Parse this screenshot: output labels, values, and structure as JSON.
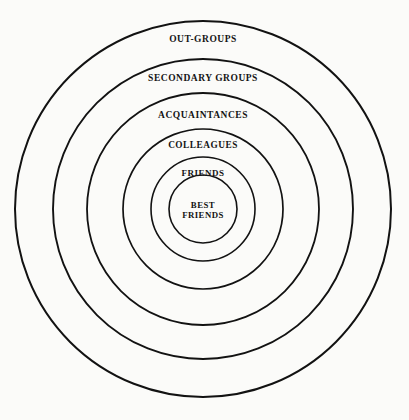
{
  "diagram": {
    "type": "concentric-circles",
    "background_color": "#fbfbf9",
    "stroke_color": "#121212",
    "center": {
      "x": 203,
      "y": 209
    },
    "rings": [
      {
        "id": "out-groups",
        "label": "OUT-GROUPS",
        "radius": 188,
        "stroke_width": 2.0,
        "label_x": 203,
        "label_y": 40,
        "level": 6
      },
      {
        "id": "secondary-groups",
        "label": "SECONDARY GROUPS",
        "radius": 150,
        "stroke_width": 1.9,
        "label_x": 203,
        "label_y": 79,
        "level": 5
      },
      {
        "id": "acquaintances",
        "label": "ACQUAINTANCES",
        "radius": 116,
        "stroke_width": 1.8,
        "label_x": 203,
        "label_y": 116,
        "level": 4
      },
      {
        "id": "colleagues",
        "label": "COLLEAGUES",
        "radius": 80,
        "stroke_width": 1.7,
        "label_x": 203,
        "label_y": 145,
        "level": 3
      },
      {
        "id": "friends",
        "label": "FRIENDS",
        "radius": 52,
        "stroke_width": 1.6,
        "label_x": 203,
        "label_y": 173,
        "level": 2
      },
      {
        "id": "best-friends",
        "label": "BEST FRIENDS",
        "radius": 34,
        "stroke_width": 1.6,
        "label_x": 203,
        "label_y": 210,
        "level": 1
      }
    ]
  }
}
